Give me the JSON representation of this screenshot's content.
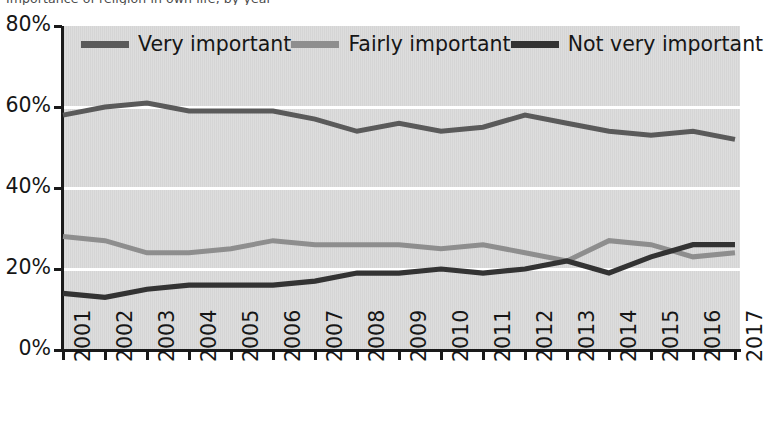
{
  "caption": {
    "clipped_top_text": "Importance of religion in own life, by year"
  },
  "legend": {
    "items": [
      {
        "label": "Very important",
        "color": "#5a5a5a",
        "name": "legend-very-important"
      },
      {
        "label": "Fairly important",
        "color": "#8e8e8e",
        "name": "legend-fairly-important"
      },
      {
        "label": "Not very important",
        "color": "#333333",
        "name": "legend-not-very-important"
      }
    ]
  },
  "colors": {
    "plot_background": "#d5d5d5",
    "gridline": "#ffffff",
    "axis": "#1a1a1a",
    "very_important": "#5a5a5a",
    "fairly_important": "#8e8e8e",
    "not_very_important": "#333333"
  },
  "chart_data": {
    "type": "line",
    "title": "",
    "subtitle": "",
    "xlabel": "",
    "ylabel": "",
    "ylim": [
      0,
      80
    ],
    "yticks": [
      0,
      20,
      40,
      60,
      80
    ],
    "ytick_labels": [
      "0%",
      "20%",
      "40%",
      "60%",
      "80%"
    ],
    "grid": true,
    "grid_axis": "y",
    "legend_position": "top-inside",
    "x": [
      2001,
      2002,
      2003,
      2004,
      2005,
      2006,
      2007,
      2008,
      2009,
      2010,
      2011,
      2012,
      2013,
      2014,
      2015,
      2016,
      2017
    ],
    "xtick_labels": [
      "2001",
      "2002",
      "2003",
      "2004",
      "2005",
      "2006",
      "2007",
      "2008",
      "2009",
      "2010",
      "2011",
      "2012",
      "2013",
      "2014",
      "2015",
      "2016",
      "2017"
    ],
    "series": [
      {
        "name": "Very important",
        "color": "#5a5a5a",
        "values": [
          58,
          60,
          61,
          59,
          59,
          59,
          57,
          54,
          56,
          54,
          55,
          58,
          56,
          54,
          53,
          54,
          52
        ]
      },
      {
        "name": "Fairly important",
        "color": "#8e8e8e",
        "values": [
          28,
          27,
          24,
          24,
          25,
          27,
          26,
          26,
          26,
          25,
          26,
          24,
          22,
          27,
          26,
          23,
          24
        ]
      },
      {
        "name": "Not very important",
        "color": "#333333",
        "values": [
          14,
          13,
          15,
          16,
          16,
          16,
          17,
          19,
          19,
          20,
          19,
          20,
          22,
          19,
          23,
          26,
          26
        ]
      }
    ]
  }
}
